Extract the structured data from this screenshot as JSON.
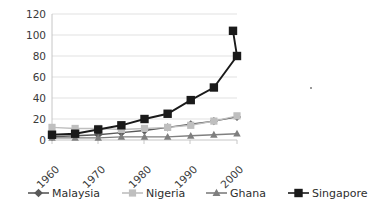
{
  "chart_data": {
    "type": "line",
    "title": "",
    "subtitle": "",
    "xlabel": "",
    "ylabel": "",
    "ylim": [
      0,
      120
    ],
    "yticks": [
      0,
      20,
      40,
      60,
      80,
      100,
      120
    ],
    "xticks": [
      "1960",
      "1970",
      "1980",
      "1990",
      "2000"
    ],
    "x": [
      1960,
      1965,
      1970,
      1975,
      1980,
      1985,
      1990,
      1995,
      2000
    ],
    "grid": true,
    "legend_position": "bottom",
    "series": [
      {
        "name": "Malaysia",
        "marker": "diamond",
        "color": "#595959",
        "values": [
          3,
          4,
          5,
          7,
          9,
          12,
          15,
          18,
          22
        ]
      },
      {
        "name": "Nigeria",
        "marker": "square",
        "color": "#bfbfbf",
        "values": [
          12,
          11,
          11,
          10,
          11,
          12,
          14,
          18,
          23
        ]
      },
      {
        "name": "Ghana",
        "marker": "triangle",
        "color": "#7f7f7f",
        "values": [
          2,
          2,
          2,
          3,
          3,
          3,
          4,
          5,
          6
        ]
      },
      {
        "name": "Singapore",
        "marker": "square",
        "color": "#1a1a1a",
        "values": [
          5,
          6,
          10,
          14,
          20,
          25,
          38,
          50,
          80
        ]
      }
    ],
    "singapore_extra_point": {
      "x": 2005,
      "value": 104
    }
  },
  "axis": {
    "y_tick_labels": [
      "120",
      "100",
      "80",
      "60",
      "40",
      "20",
      "0"
    ],
    "x_tick_labels": [
      "1960",
      "1970",
      "1980",
      "1990",
      "2000"
    ]
  },
  "legend": {
    "entries": [
      {
        "label": "Malaysia",
        "color": "#595959",
        "marker": "diamond"
      },
      {
        "label": "Nigeria",
        "color": "#bfbfbf",
        "marker": "square"
      },
      {
        "label": "Ghana",
        "color": "#7f7f7f",
        "marker": "triangle"
      },
      {
        "label": "Singapore",
        "color": "#1a1a1a",
        "marker": "square"
      }
    ]
  },
  "artifact": {
    "speck_label": "stray-dot"
  }
}
